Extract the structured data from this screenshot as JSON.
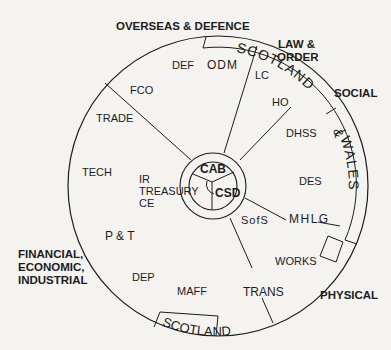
{
  "sectors": {
    "overseas_defence": "OVERSEAS & DEFENCE",
    "law_order_line1": "LAW &",
    "law_order_line2": "ORDER",
    "social": "SOCIAL",
    "physical": "PHYSICAL",
    "financial_line1": "FINANCIAL,",
    "financial_line2": "ECONOMIC,",
    "financial_line3": "INDUSTRIAL"
  },
  "departments": {
    "def": "DEF",
    "odm": "ODM",
    "fco": "FCO",
    "trade": "TRADE",
    "tech": "TECH",
    "ir": "IR",
    "treasury": "TREASURY",
    "ce": "CE",
    "pt": "P & T",
    "dep": "DEP",
    "maff": "MAFF",
    "trans": "TRANS",
    "works": "WORKS",
    "mhlg": "MHLG",
    "sofs": "SofS",
    "des": "DES",
    "dhss": "DHSS",
    "ho": "HO",
    "lc": "LC"
  },
  "hub": {
    "cab": "CAB",
    "csd": "CSD"
  },
  "ring_labels": {
    "scotland_top": "SCOTLAND",
    "ampersand": "&",
    "wales": "WALES",
    "scotland_bottom": "SCOTLAND"
  },
  "colors": {
    "background": "#f4f3f0",
    "ink": "#1c1c1c"
  }
}
